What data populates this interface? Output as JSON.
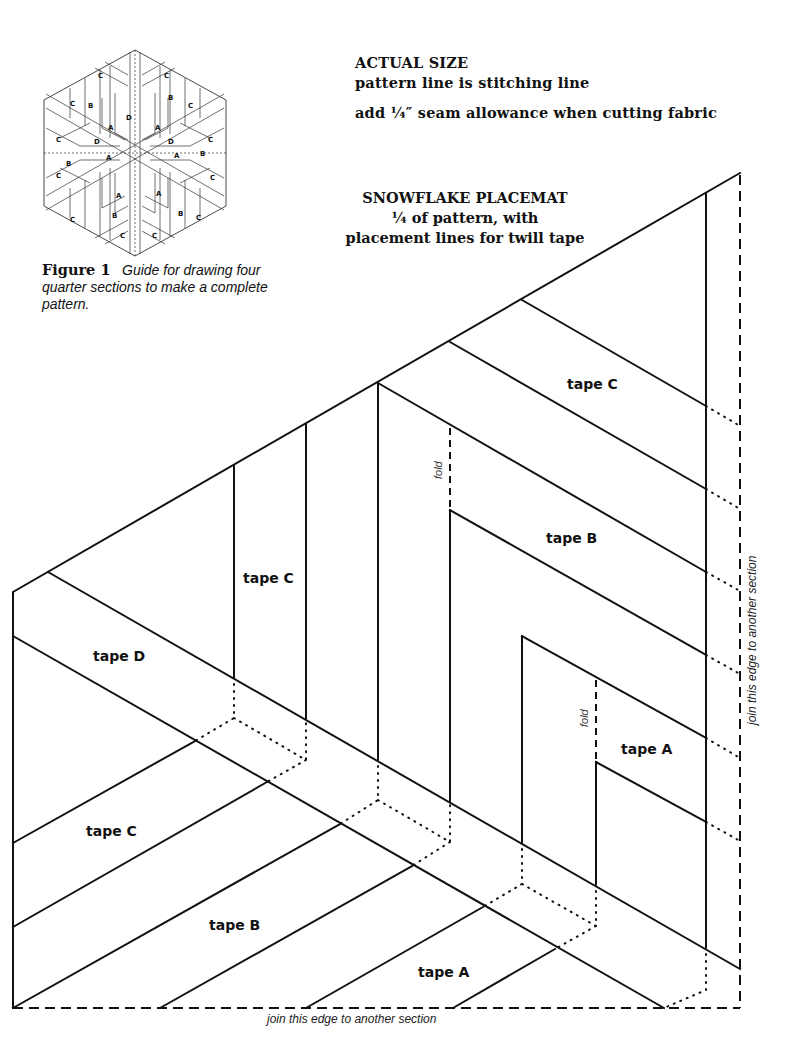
{
  "header": {
    "title": "ACTUAL SIZE",
    "subtitle": "pattern line is stitching line",
    "note": "add ¼″ seam allowance when cutting fabric"
  },
  "figure": {
    "label": "Figure 1",
    "caption": "Guide for drawing four quarter sections to make a complete pattern.",
    "hex_labels": [
      "A",
      "B",
      "C",
      "D"
    ]
  },
  "pattern": {
    "title": "SNOWFLAKE PLACEMAT",
    "line1": "¼ of pattern, with",
    "line2": "placement lines for twill tape"
  },
  "tapes": {
    "c_upper_right": "tape C",
    "b_upper_right": "tape B",
    "a_right": "tape A",
    "c_vertical": "tape C",
    "d_left": "tape D",
    "c_lower_left": "tape C",
    "b_lower": "tape B",
    "a_lower": "tape A"
  },
  "annotations": {
    "fold_upper": "fold",
    "fold_lower": "fold",
    "join_right": "join this edge to another section",
    "join_bottom": "join this edge to another section"
  },
  "colors": {
    "ink": "#111111",
    "paper": "#ffffff"
  }
}
